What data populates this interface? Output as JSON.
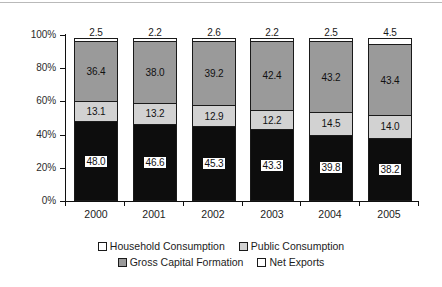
{
  "chart_data": {
    "type": "bar",
    "subtype": "stacked-100-percent",
    "title": "",
    "subtitle": "",
    "xlabel": "",
    "ylabel": "",
    "categories": [
      "2000",
      "2001",
      "2002",
      "2003",
      "2004",
      "2005"
    ],
    "ylim": [
      0,
      100
    ],
    "ytick_labels": [
      "0%",
      "20%",
      "40%",
      "60%",
      "80%",
      "100%"
    ],
    "ytick_values": [
      0,
      20,
      40,
      60,
      80,
      100
    ],
    "grid": false,
    "legend_position": "bottom",
    "stack_order_bottom_to_top": [
      "Household Consumption",
      "Public Consumption",
      "Gross Capital Formation",
      "Net Exports"
    ],
    "series": [
      {
        "name": "Household Consumption",
        "color": "#0d0d0d",
        "values": [
          48.0,
          46.6,
          45.3,
          43.3,
          39.8,
          38.2
        ],
        "labels": [
          "48.0",
          "46.6",
          "45.3",
          "43.3",
          "39.8",
          "38.2"
        ]
      },
      {
        "name": "Public Consumption",
        "color": "#d2d2d2",
        "values": [
          13.1,
          13.2,
          12.9,
          12.2,
          14.5,
          14.0
        ],
        "labels": [
          "13.1",
          "13.2",
          "12.9",
          "12.2",
          "14.5",
          "14.0"
        ]
      },
      {
        "name": "Gross Capital Formation",
        "color": "#9a9a9a",
        "values": [
          36.4,
          38.0,
          39.2,
          42.4,
          43.2,
          43.4
        ],
        "labels": [
          "36.4",
          "38.0",
          "39.2",
          "42.4",
          "43.2",
          "43.4"
        ]
      },
      {
        "name": "Net Exports",
        "color": "#ffffff",
        "values": [
          2.5,
          2.2,
          2.6,
          2.2,
          2.5,
          4.5
        ],
        "labels": [
          "2.5",
          "2.2",
          "2.6",
          "2.2",
          "2.5",
          "4.5"
        ]
      }
    ]
  },
  "axis": {
    "y_ticks": [
      {
        "label": "100%",
        "value": 100
      },
      {
        "label": "80%",
        "value": 80
      },
      {
        "label": "60%",
        "value": 60
      },
      {
        "label": "40%",
        "value": 40
      },
      {
        "label": "20%",
        "value": 20
      },
      {
        "label": "0%",
        "value": 0
      }
    ],
    "x_ticks": [
      "2000",
      "2001",
      "2002",
      "2003",
      "2004",
      "2005"
    ]
  },
  "legend": {
    "rows": [
      [
        {
          "label": "Household Consumption",
          "swatch": "household"
        },
        {
          "label": "Public Consumption",
          "swatch": "public"
        }
      ],
      [
        {
          "label": "Gross Capital Formation",
          "swatch": "gross"
        },
        {
          "label": "Net Exports",
          "swatch": "net"
        }
      ]
    ]
  }
}
